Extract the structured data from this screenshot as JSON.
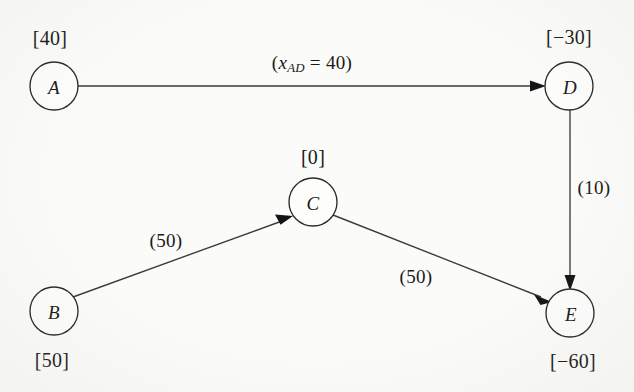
{
  "diagram": {
    "background_color": "#fbfbf9",
    "line_color": "#3a3a3a",
    "text_color": "#1a1a1a"
  },
  "nodes": [
    {
      "id": "A",
      "letter": "A",
      "value_label": "[40]",
      "value": 40,
      "role": "supply",
      "cx": 54,
      "cy": 86,
      "r": 24,
      "label_x": 50,
      "label_y": 38
    },
    {
      "id": "B",
      "letter": "B",
      "value_label": "[50]",
      "value": 50,
      "role": "supply",
      "cx": 54,
      "cy": 311,
      "r": 24,
      "label_x": 52,
      "label_y": 360
    },
    {
      "id": "C",
      "letter": "C",
      "value_label": "[0]",
      "value": 0,
      "role": "transshipment",
      "cx": 313,
      "cy": 202,
      "r": 24,
      "label_x": 313,
      "label_y": 157
    },
    {
      "id": "D",
      "letter": "D",
      "value_label": "[-30]",
      "value": -30,
      "role": "demand",
      "cx": 569,
      "cy": 86,
      "r": 24,
      "label_x": 569,
      "label_y": 37
    },
    {
      "id": "E",
      "letter": "E",
      "value_label": "[-60]",
      "value": -60,
      "role": "demand",
      "cx": 570,
      "cy": 313,
      "r": 24,
      "label_x": 573,
      "label_y": 361
    }
  ],
  "edges": [
    {
      "id": "A-D",
      "from": "A",
      "to": "D",
      "label_kind": "flow",
      "label_text": "(xAD = 40)",
      "label_prefix": "(",
      "label_var": "x",
      "label_sub": "AD",
      "label_mid": " = ",
      "label_value": "40",
      "label_suffix": ")",
      "label_x": 312,
      "label_y": 64
    },
    {
      "id": "B-C",
      "from": "B",
      "to": "C",
      "label_kind": "capacity",
      "label_text": "(50)",
      "label_value": "50",
      "label_x": 166,
      "label_y": 240
    },
    {
      "id": "C-E",
      "from": "C",
      "to": "E",
      "label_kind": "capacity",
      "label_text": "(50)",
      "label_value": "50",
      "label_x": 416,
      "label_y": 276
    },
    {
      "id": "D-E",
      "from": "D",
      "to": "E",
      "label_kind": "capacity",
      "label_text": "(10)",
      "label_value": "10",
      "label_x": 594,
      "label_y": 187
    }
  ]
}
